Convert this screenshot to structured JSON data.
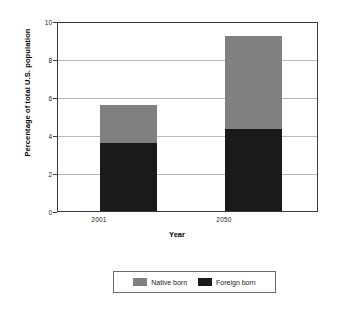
{
  "chart_data": {
    "type": "bar",
    "subtype": "stacked-bar",
    "title": "",
    "xlabel": "Year",
    "ylabel": "Percentage of total U.S. population",
    "categories": [
      "2001",
      "2050"
    ],
    "series": [
      {
        "name": "Foreign born",
        "values": [
          3.6,
          4.3
        ],
        "color": "#1a1a1a"
      },
      {
        "name": "Native born",
        "values": [
          2.0,
          4.9
        ],
        "color": "#808080"
      }
    ],
    "totals": [
      5.6,
      9.2
    ],
    "ylim": [
      0,
      10
    ],
    "yticks": [
      0,
      2,
      4,
      6,
      8,
      10
    ],
    "ytick_labels": [
      "0",
      "2",
      "4",
      "6",
      "8",
      "10"
    ],
    "grid": true,
    "grid_axis": "y",
    "legend_position": "bottom",
    "legend_entries": [
      "Native born",
      "Foreign born"
    ],
    "stack_order": [
      "Foreign born",
      "Native born"
    ],
    "background": "#ffffff",
    "frame_color": "#3a3a3a",
    "gridline_color": "#b9b9b9"
  }
}
